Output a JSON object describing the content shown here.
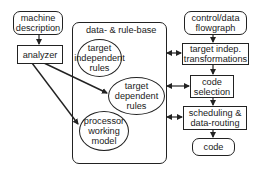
{
  "diagram": {
    "nodes": {
      "machine_description": {
        "label": "machine\ndescription",
        "shape": "rounded-rect"
      },
      "analyzer": {
        "label": "analyzer",
        "shape": "rect"
      },
      "control_data_flowgraph": {
        "label": "control/data\nflowgraph",
        "shape": "rounded-rect"
      },
      "target_indep_transformations": {
        "label": "target indep.\ntransformations",
        "shape": "rect"
      },
      "code_selection": {
        "label": "code\nselection",
        "shape": "rect"
      },
      "scheduling_data_routing": {
        "label": "scheduling &\ndata-routing",
        "shape": "rect"
      },
      "code": {
        "label": "code",
        "shape": "rounded-rect"
      },
      "target_independent_rules": {
        "label": "target\nindependent\nrules",
        "shape": "ellipse"
      },
      "target_dependent_rules": {
        "label": "target\ndependent\nrules",
        "shape": "ellipse"
      },
      "processor_working_model": {
        "label": "processor\nworking\nmodel",
        "shape": "ellipse"
      }
    },
    "container": {
      "title": "data- & rule-base"
    },
    "edges": [
      {
        "from": "machine_description",
        "to": "analyzer",
        "type": "arrow"
      },
      {
        "from": "analyzer",
        "to": "target_dependent_rules",
        "type": "arrow"
      },
      {
        "from": "analyzer",
        "to": "processor_working_model",
        "type": "arrow"
      },
      {
        "from": "control_data_flowgraph",
        "to": "target_indep_transformations",
        "type": "arrow"
      },
      {
        "from": "target_indep_transformations",
        "to": "code_selection",
        "type": "arrow"
      },
      {
        "from": "code_selection",
        "to": "scheduling_data_routing",
        "type": "arrow"
      },
      {
        "from": "scheduling_data_routing",
        "to": "code",
        "type": "arrow"
      },
      {
        "from": "data_rule_base",
        "to": "target_indep_transformations",
        "type": "bidirectional"
      },
      {
        "from": "data_rule_base",
        "to": "code_selection",
        "type": "bidirectional"
      },
      {
        "from": "data_rule_base",
        "to": "scheduling_data_routing",
        "type": "bidirectional"
      }
    ]
  }
}
